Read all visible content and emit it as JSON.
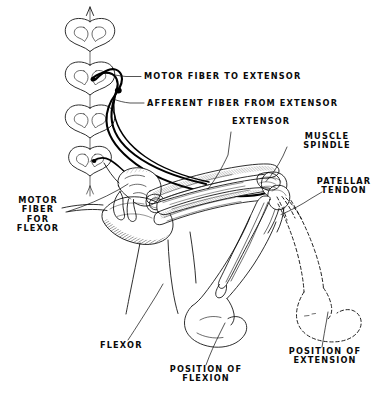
{
  "figure": {
    "background_color": "#ffffff",
    "ink_color": "#0a0a0a",
    "width": 388,
    "height": 394
  },
  "labels": {
    "motor_fiber_to_extensor": "MOTOR FIBER TO EXTENSOR",
    "afferent_fiber_from_extensor": "AFFERENT FIBER FROM EXTENSOR",
    "extensor": "EXTENSOR",
    "muscle_spindle": "MUSCLE\nSPINDLE",
    "patellar_tendon": "PATELLAR\nTENDON",
    "motor_fiber_for_flexor": "MOTOR\nFIBER\nFOR\nFLEXOR",
    "flexor": "FLEXOR",
    "position_of_flexion": "POSITION OF\nFLEXION",
    "position_of_extension": "POSITION OF\nEXTENSION"
  },
  "structures": {
    "spinal_cord_sections": [
      {
        "name": "spinal-cord-section-1",
        "cx": 90,
        "cy": 38
      },
      {
        "name": "spinal-cord-section-2",
        "cx": 90,
        "cy": 82
      },
      {
        "name": "spinal-cord-section-3",
        "cx": 90,
        "cy": 125
      },
      {
        "name": "spinal-cord-section-4",
        "cx": 90,
        "cy": 166
      }
    ],
    "spinal_axis": "vertical arrow through cord sections",
    "afferent_neuron": "dorsal root ganglion loop entering cord section 2",
    "motor_neuron_extensor": "ventral root fiber leaving cord section 2",
    "motor_neuron_flexor": "ventral root fiber leaving cord section 4",
    "extensor_muscle": "quadriceps group on anterior thigh",
    "flexor_muscle": "hamstring group on posterior thigh",
    "pelvis": "hip bone with femoral head",
    "femur": "thigh bone",
    "tibia_fibula": "lower leg bones",
    "foot_flexed": "solid outline foot in flexion",
    "foot_extended": "dashed outline foot in extension"
  }
}
